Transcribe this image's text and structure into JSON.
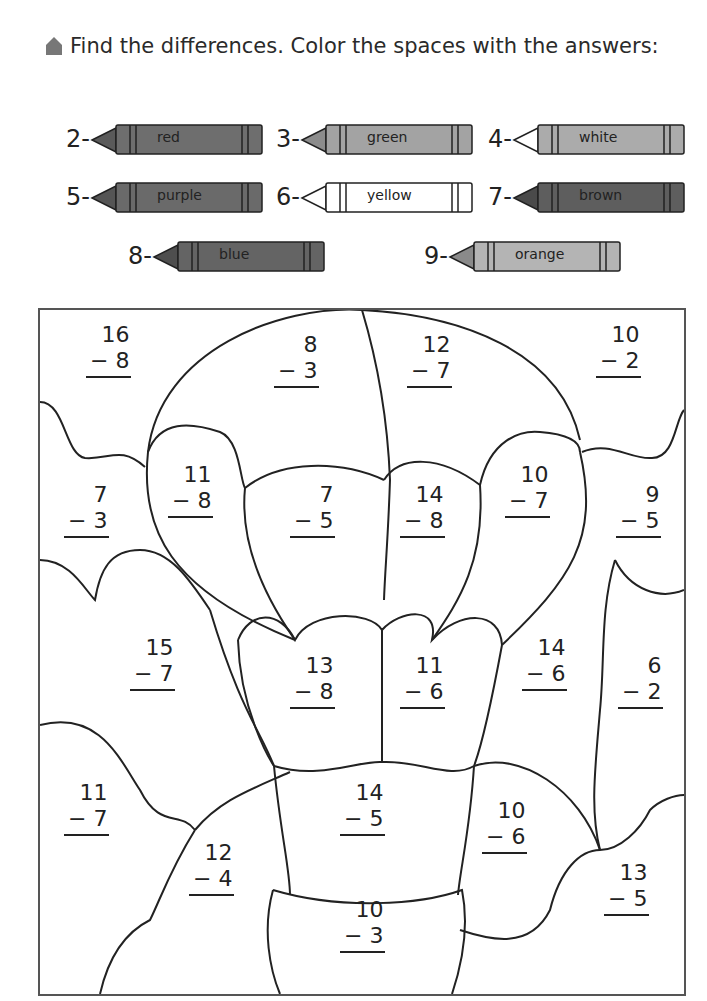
{
  "instruction": "Find the differences. Color the spaces with the answers:",
  "crayons": [
    {
      "num": "2-",
      "label": "red",
      "color": "#6e6e6e",
      "tip": "#5a5a5a",
      "x": 62,
      "y": 122
    },
    {
      "num": "3-",
      "label": "green",
      "color": "#a3a3a3",
      "tip": "#8c8c8c",
      "x": 272,
      "y": 122
    },
    {
      "num": "4-",
      "label": "white",
      "color": "#ababab",
      "tip": "#ffffff",
      "x": 484,
      "y": 122
    },
    {
      "num": "5-",
      "label": "purple",
      "color": "#6a6a6a",
      "tip": "#555555",
      "x": 62,
      "y": 180
    },
    {
      "num": "6-",
      "label": "yellow",
      "color": "#ffffff",
      "tip": "#ffffff",
      "x": 272,
      "y": 180
    },
    {
      "num": "7-",
      "label": "brown",
      "color": "#5e5e5e",
      "tip": "#4a4a4a",
      "x": 484,
      "y": 180
    },
    {
      "num": "8-",
      "label": "blue",
      "color": "#646464",
      "tip": "#4e4e4e",
      "x": 124,
      "y": 239
    },
    {
      "num": "9-",
      "label": "orange",
      "color": "#b4b4b4",
      "tip": "#8a8a8a",
      "x": 420,
      "y": 239
    }
  ],
  "problems": [
    {
      "top": "16",
      "bottom": "−  8",
      "x": 84,
      "y": 320
    },
    {
      "top": "8",
      "bottom": "−  3",
      "x": 272,
      "y": 330
    },
    {
      "top": "12",
      "bottom": "−  7",
      "x": 405,
      "y": 330
    },
    {
      "top": "10",
      "bottom": "−  2",
      "x": 594,
      "y": 320
    },
    {
      "top": "11",
      "bottom": "−  8",
      "x": 166,
      "y": 460
    },
    {
      "top": "7",
      "bottom": "−  3",
      "x": 62,
      "y": 480
    },
    {
      "top": "7",
      "bottom": "−  5",
      "x": 288,
      "y": 480
    },
    {
      "top": "14",
      "bottom": "−  8",
      "x": 398,
      "y": 480
    },
    {
      "top": "10",
      "bottom": "−  7",
      "x": 503,
      "y": 460
    },
    {
      "top": "9",
      "bottom": "−  5",
      "x": 614,
      "y": 480
    },
    {
      "top": "15",
      "bottom": "−  7",
      "x": 128,
      "y": 633
    },
    {
      "top": "13",
      "bottom": "−  8",
      "x": 288,
      "y": 651
    },
    {
      "top": "11",
      "bottom": "−  6",
      "x": 398,
      "y": 651
    },
    {
      "top": "14",
      "bottom": "−  6",
      "x": 520,
      "y": 633
    },
    {
      "top": "6",
      "bottom": "−  2",
      "x": 616,
      "y": 651
    },
    {
      "top": "11",
      "bottom": "−  7",
      "x": 62,
      "y": 778
    },
    {
      "top": "14",
      "bottom": "−  5",
      "x": 338,
      "y": 778
    },
    {
      "top": "10",
      "bottom": "−  6",
      "x": 480,
      "y": 796
    },
    {
      "top": "12",
      "bottom": "−  4",
      "x": 187,
      "y": 838
    },
    {
      "top": "13",
      "bottom": "−  5",
      "x": 602,
      "y": 858
    },
    {
      "top": "10",
      "bottom": "−  3",
      "x": 338,
      "y": 895
    }
  ]
}
